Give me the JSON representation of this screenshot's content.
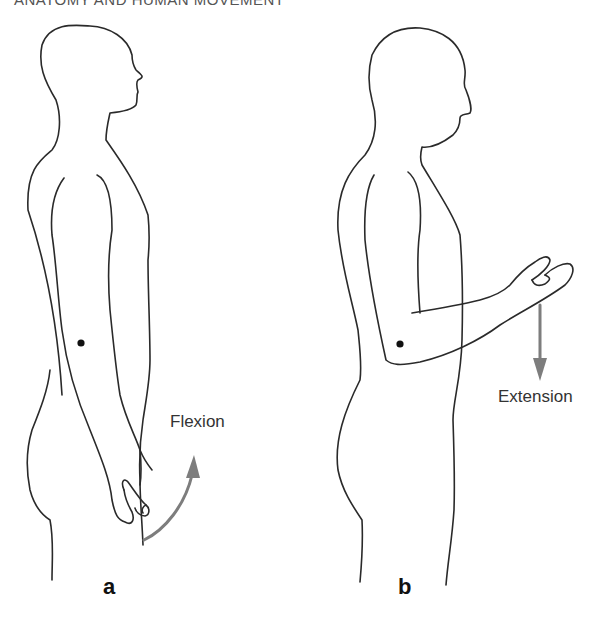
{
  "page": {
    "running_head": "ANATOMY AND HUMAN MOVEMENT"
  },
  "figure": {
    "panels": [
      {
        "id": "a",
        "label": "a",
        "annotation": "Flexion",
        "arrow_direction": "up-curved"
      },
      {
        "id": "b",
        "label": "b",
        "annotation": "Extension",
        "arrow_direction": "down"
      }
    ],
    "colors": {
      "outline": "#2a2a2a",
      "arrow": "#7d7d7d",
      "text": "#333333"
    }
  }
}
